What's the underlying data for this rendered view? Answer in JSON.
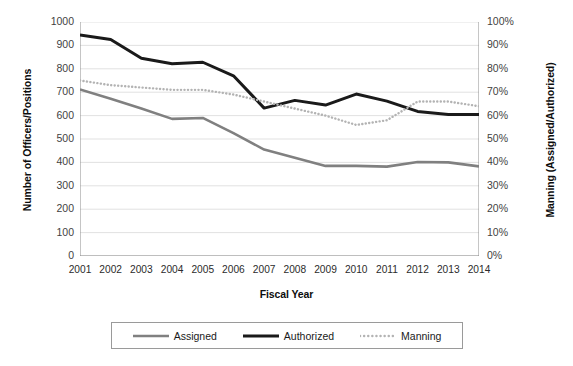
{
  "chart_data": {
    "type": "line",
    "title": "",
    "xlabel": "Fiscal Year",
    "ylabel": "Number of Officers/Positions",
    "y2label": "Manning (Assigned/Authorized)",
    "categories": [
      "2001",
      "2002",
      "2003",
      "2004",
      "2005",
      "2006",
      "2007",
      "2008",
      "2009",
      "2010",
      "2011",
      "2012",
      "2013",
      "2014"
    ],
    "ylim": [
      0,
      1000
    ],
    "y2lim": [
      0,
      100
    ],
    "yticks": [
      "1000",
      "900",
      "800",
      "700",
      "600",
      "500",
      "400",
      "300",
      "200",
      "100",
      "0"
    ],
    "y2ticks": [
      "100%",
      "90%",
      "80%",
      "70%",
      "60%",
      "50%",
      "40%",
      "30%",
      "20%",
      "10%",
      "0%"
    ],
    "grid": true,
    "legend_position": "bottom",
    "series": [
      {
        "name": "Assigned",
        "axis": "left",
        "style": "solid",
        "color": "#808080",
        "values": [
          712,
          672,
          630,
          586,
          590,
          525,
          455,
          420,
          385,
          385,
          382,
          402,
          400,
          383
        ]
      },
      {
        "name": "Authorized",
        "axis": "left",
        "style": "solid",
        "color": "#1a1a1a",
        "values": [
          945,
          925,
          845,
          822,
          828,
          770,
          632,
          665,
          645,
          692,
          662,
          618,
          605,
          605
        ]
      },
      {
        "name": "Manning",
        "axis": "right",
        "style": "dotted",
        "color": "#b3b3b3",
        "values": [
          75,
          73,
          72,
          71,
          71,
          69,
          66,
          63,
          60,
          56,
          58,
          66,
          66,
          64
        ]
      }
    ]
  },
  "legend": {
    "items": [
      {
        "label": "Assigned",
        "color": "#808080",
        "style": "solid",
        "icon": "line-swatch-assigned"
      },
      {
        "label": "Authorized",
        "color": "#1a1a1a",
        "style": "solid",
        "icon": "line-swatch-authorized"
      },
      {
        "label": "Manning",
        "color": "#b3b3b3",
        "style": "dotted",
        "icon": "line-swatch-manning"
      }
    ]
  }
}
